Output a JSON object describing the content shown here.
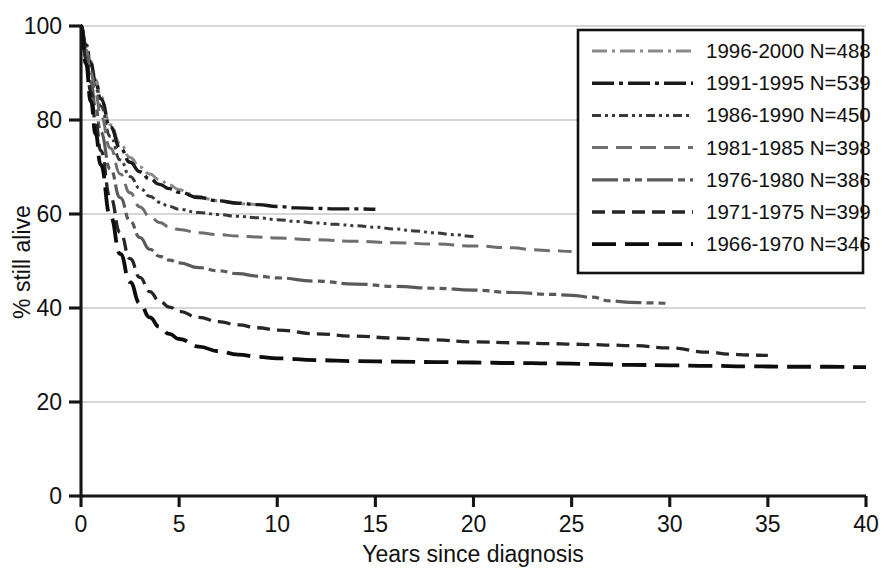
{
  "chart_data": {
    "type": "line",
    "title": "",
    "xlabel": "Years since diagnosis",
    "ylabel": "% still alive",
    "xlim": [
      0,
      40
    ],
    "ylim": [
      0,
      100
    ],
    "xticks": [
      "0",
      "5",
      "10",
      "15",
      "20",
      "25",
      "30",
      "35",
      "40"
    ],
    "yticks": [
      "0",
      "20",
      "40",
      "60",
      "80",
      "100"
    ],
    "grid": "horizontal",
    "legend_position": "top-right",
    "series": [
      {
        "name": "1996-2000 N=488",
        "period": "1996-2000",
        "n": 488,
        "line_style": "dash-dot",
        "color": "#8a8a8a",
        "stroke_width": 3.0,
        "dasharray": "15,5,3,5",
        "x": [
          0,
          0.25,
          0.5,
          0.75,
          1,
          1.5,
          2,
          2.5,
          3,
          3.5,
          4,
          4.5,
          5,
          5.5,
          6,
          6.5,
          7,
          7.5,
          8,
          8.5,
          9
        ],
        "y": [
          100,
          96.5,
          92.5,
          88.5,
          85,
          79,
          75,
          72,
          70,
          68.5,
          67.3,
          66.2,
          65.2,
          64.3,
          63.7,
          63.2,
          62.8,
          62.5,
          62.3,
          62.1,
          62.0
        ]
      },
      {
        "name": "1991-1995 N=539",
        "period": "1991-1995",
        "n": 539,
        "line_style": "dash-dot",
        "color": "#1a1a1a",
        "stroke_width": 3.4,
        "dasharray": "22,5,4,5",
        "x": [
          0,
          0.25,
          0.5,
          0.75,
          1,
          1.5,
          2,
          2.5,
          3,
          3.5,
          4,
          4.5,
          5,
          6,
          7,
          8,
          9,
          10,
          11,
          12,
          13,
          14,
          15
        ],
        "y": [
          100,
          96,
          92,
          88,
          84.5,
          78.5,
          74,
          71,
          69,
          67.5,
          66.3,
          65.4,
          64.6,
          63.5,
          62.8,
          62.3,
          62.0,
          61.6,
          61.3,
          61.2,
          61.1,
          61.1,
          61.0
        ]
      },
      {
        "name": "1986-1990 N=450",
        "period": "1986-1990",
        "n": 450,
        "line_style": "dash-dot-dot",
        "color": "#3a3a3a",
        "stroke_width": 3.0,
        "dasharray": "9,4,3,4,3,4",
        "x": [
          0,
          0.25,
          0.5,
          0.75,
          1,
          1.5,
          2,
          2.5,
          3,
          3.5,
          4,
          4.5,
          5,
          6,
          7,
          8,
          9,
          10,
          11,
          12,
          13,
          14,
          15,
          16,
          17,
          18,
          19,
          20
        ],
        "y": [
          100,
          95.5,
          91,
          87,
          83,
          76.5,
          71.5,
          68,
          65.5,
          63.8,
          62.5,
          61.6,
          61.0,
          60.3,
          59.9,
          59.5,
          59.2,
          58.8,
          58.4,
          58.1,
          57.8,
          57.5,
          57.2,
          56.8,
          56.4,
          56.0,
          55.6,
          55.2
        ]
      },
      {
        "name": "1981-1985 N=398",
        "period": "1981-1985",
        "n": 398,
        "line_style": "dashed",
        "color": "#6e6e6e",
        "stroke_width": 3.0,
        "dasharray": "16,8",
        "x": [
          0,
          0.25,
          0.5,
          0.75,
          1,
          1.5,
          2,
          2.5,
          3,
          3.5,
          4,
          4.5,
          5,
          6,
          7,
          8,
          9,
          10,
          12,
          14,
          16,
          18,
          20,
          22,
          23,
          24,
          25
        ],
        "y": [
          100,
          95,
          90,
          85.5,
          81,
          74,
          68.5,
          64.5,
          61.5,
          59.5,
          58.2,
          57.3,
          56.7,
          56.0,
          55.6,
          55.3,
          55.1,
          54.9,
          54.5,
          54.2,
          53.9,
          53.6,
          53.2,
          52.8,
          52.4,
          52.2,
          52.0
        ]
      },
      {
        "name": "1976-1980 N=386",
        "period": "1976-1980",
        "n": 386,
        "line_style": "long-short-dash",
        "color": "#5a5a5a",
        "stroke_width": 3.2,
        "dasharray": "26,5,7,5,7,5",
        "x": [
          0,
          0.25,
          0.5,
          0.75,
          1,
          1.5,
          2,
          2.5,
          3,
          3.5,
          4,
          4.5,
          5,
          6,
          7,
          8,
          9,
          10,
          12,
          14,
          16,
          18,
          20,
          22,
          24,
          25,
          26,
          27,
          28,
          29,
          30
        ],
        "y": [
          100,
          94,
          88,
          82.5,
          77.5,
          69.5,
          63.5,
          58.5,
          55,
          52.5,
          51,
          50.2,
          49.6,
          48.6,
          47.9,
          47.3,
          46.8,
          46.4,
          45.7,
          45.1,
          44.6,
          44.2,
          43.8,
          43.3,
          42.9,
          42.7,
          42.3,
          41.5,
          41.2,
          41.1,
          41.0
        ]
      },
      {
        "name": "1971-1975 N=399",
        "period": "1971-1975",
        "n": 399,
        "line_style": "dashed",
        "color": "#262626",
        "stroke_width": 3.3,
        "dasharray": "13,7",
        "x": [
          0,
          0.25,
          0.5,
          0.75,
          1,
          1.5,
          2,
          2.5,
          3,
          3.5,
          4,
          4.5,
          5,
          6,
          7,
          8,
          9,
          10,
          12,
          14,
          16,
          18,
          20,
          22,
          24,
          25,
          26,
          27,
          28,
          30,
          32,
          33,
          34,
          35
        ],
        "y": [
          100,
          93,
          86,
          79.5,
          73.5,
          63.5,
          56,
          50.5,
          46.5,
          43.5,
          41.5,
          40.2,
          39.3,
          38.0,
          37.1,
          36.4,
          35.8,
          35.3,
          34.5,
          34.0,
          33.6,
          33.2,
          32.8,
          32.6,
          32.4,
          32.3,
          32.2,
          32.1,
          32.0,
          31.5,
          30.6,
          30.2,
          30.0,
          29.9
        ]
      },
      {
        "name": "1966-1970 N=346",
        "period": "1966-1970",
        "n": 346,
        "line_style": "long-dash",
        "color": "#0d0d0d",
        "stroke_width": 3.8,
        "dasharray": "24,9",
        "x": [
          0,
          0.25,
          0.5,
          0.75,
          1,
          1.5,
          2,
          2.5,
          3,
          3.5,
          4,
          4.5,
          5,
          6,
          7,
          8,
          9,
          10,
          12,
          14,
          16,
          18,
          20,
          22,
          24,
          26,
          28,
          30,
          32,
          34,
          36,
          38,
          40
        ],
        "y": [
          100,
          92,
          84,
          77,
          70.5,
          59.5,
          51.5,
          45.5,
          41,
          38,
          36,
          34.5,
          33.4,
          31.8,
          30.8,
          30.1,
          29.6,
          29.3,
          28.9,
          28.7,
          28.6,
          28.5,
          28.4,
          28.3,
          28.2,
          28.1,
          27.9,
          27.8,
          27.7,
          27.6,
          27.5,
          27.5,
          27.4
        ]
      }
    ]
  },
  "legend": {
    "entries": [
      "1996-2000 N=488",
      "1991-1995 N=539",
      "1986-1990 N=450",
      "1981-1985 N=398",
      "1976-1980 N=386",
      "1971-1975 N=399",
      "1966-1970 N=346"
    ]
  }
}
